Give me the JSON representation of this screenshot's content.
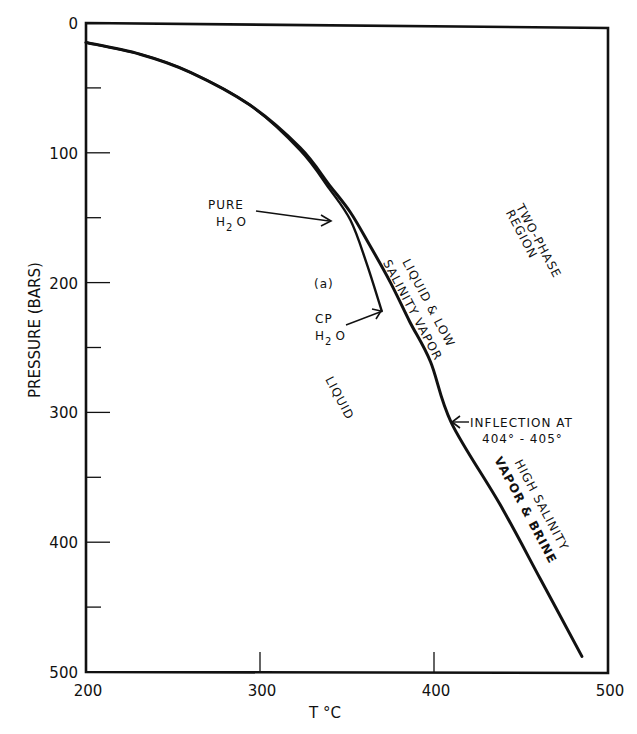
{
  "chart_data": {
    "type": "line",
    "title": "",
    "xlabel": "T °C",
    "ylabel": "PRESSURE (BARS)",
    "xlim": [
      200,
      500
    ],
    "ylim": [
      0,
      500
    ],
    "y_inverted": true,
    "grid": false,
    "x_ticks": [
      200,
      300,
      400,
      500
    ],
    "x_tick_labels": [
      "200",
      "300",
      "400",
      "500"
    ],
    "y_ticks": [
      0,
      100,
      200,
      300,
      400,
      500
    ],
    "y_tick_labels": [
      "0",
      "100",
      "200",
      "300",
      "400",
      "500"
    ],
    "y_minor_ticks": [
      50,
      150,
      250,
      350,
      450
    ],
    "series": [
      {
        "name": "Two-phase boundary (seawater-like solution)",
        "x": [
          200,
          231,
          260,
          294,
          323,
          340,
          352,
          363,
          375,
          386,
          398,
          410,
          438,
          461,
          485
        ],
        "y": [
          15,
          24,
          38,
          63,
          96,
          125,
          146,
          171,
          200,
          230,
          261,
          308,
          371,
          428,
          488
        ]
      },
      {
        "name": "Pure H2O",
        "x": [
          200,
          231,
          260,
          294,
          323,
          340,
          352,
          361,
          370
        ],
        "y": [
          15,
          24,
          38,
          63,
          98,
          128,
          152,
          184,
          222
        ]
      }
    ],
    "annotations": [
      {
        "text": "PURE H2O",
        "arrow_to": [
          340,
          150
        ]
      },
      {
        "text": "(a)",
        "at": [
          332,
          200
        ]
      },
      {
        "text": "CP H2O",
        "arrow_to": [
          370,
          222
        ]
      },
      {
        "text": "LIQUID",
        "at": [
          345,
          310
        ]
      },
      {
        "text": "LIQUID & LOW SALINITY VAPOR",
        "at": [
          385,
          240
        ]
      },
      {
        "text": "TWO-PHASE REGION",
        "at": [
          445,
          180
        ]
      },
      {
        "text": "INFLECTION AT 404° - 405°",
        "arrow_to": [
          410,
          308
        ]
      },
      {
        "text": "HIGH SALINITY VAPOR & BRINE",
        "at": [
          455,
          390
        ]
      }
    ]
  },
  "labels": {
    "xlabel": "T °C",
    "ylabel": "PRESSURE (BARS)",
    "pure_line1": "PURE",
    "pure_line2_h": "H",
    "pure_line2_sub": "2",
    "pure_line2_o": "O",
    "panel": "(a)",
    "cp_line1": "CP",
    "cp_line2_h": "H",
    "cp_line2_sub": "2",
    "cp_line2_o": "O",
    "liquid": "LIQUID",
    "liq_low_line1": "LIQUID & LOW",
    "liq_low_line2": "SALINITY VAPOR",
    "two_phase_line1": "TWO-PHASE",
    "two_phase_line2": "REGION",
    "inflection_line1": "INFLECTION AT",
    "inflection_line2": "404° - 405°",
    "high_sal_line1": "HIGH SALINITY",
    "high_sal_line2": "VAPOR & BRINE"
  }
}
